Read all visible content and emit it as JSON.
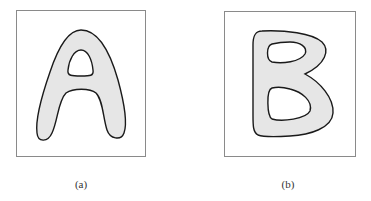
{
  "figure": {
    "panels": [
      {
        "id": "a",
        "caption": "(a)",
        "letter": "A",
        "description": "Gray-filled letter shape with a triangular hole"
      },
      {
        "id": "b",
        "caption": "(b)",
        "letter": "B",
        "description": "Gray-filled letter shape with two holes"
      }
    ],
    "colors": {
      "fill": "#e6e6e6",
      "stroke": "#1a1a1a",
      "frame": "#8a8a8a"
    }
  }
}
